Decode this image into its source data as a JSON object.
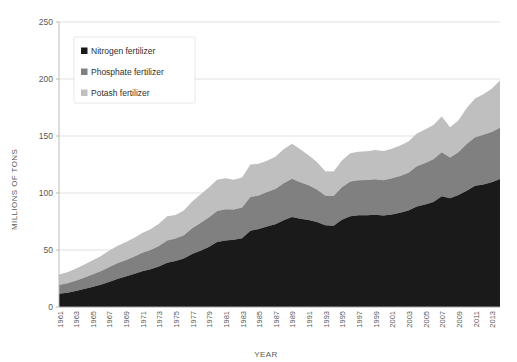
{
  "chart_data": {
    "type": "area",
    "stacked": true,
    "title": "",
    "xlabel": "YEAR",
    "ylabel": "MILLIONS OF TONS",
    "ylim": [
      0,
      250
    ],
    "yticks": [
      0,
      50,
      100,
      150,
      200,
      250
    ],
    "ytick_labels": [
      "0",
      "50",
      "100",
      "150",
      "200",
      "250"
    ],
    "grid": true,
    "grid_axis": "y",
    "legend_position": "upper-left-inside",
    "x": [
      1961,
      1962,
      1963,
      1964,
      1965,
      1966,
      1967,
      1968,
      1969,
      1970,
      1971,
      1972,
      1973,
      1974,
      1975,
      1976,
      1977,
      1978,
      1979,
      1980,
      1981,
      1982,
      1983,
      1984,
      1985,
      1986,
      1987,
      1988,
      1989,
      1990,
      1991,
      1992,
      1993,
      1994,
      1995,
      1996,
      1997,
      1998,
      1999,
      2000,
      2001,
      2002,
      2003,
      2004,
      2005,
      2006,
      2007,
      2008,
      2009,
      2010,
      2011,
      2012,
      2013,
      2014
    ],
    "xtick_labels": [
      "1961",
      "1963",
      "1965",
      "1967",
      "1969",
      "1971",
      "1973",
      "1975",
      "1977",
      "1979",
      "1981",
      "1983",
      "1985",
      "1987",
      "1989",
      "1991",
      "1993",
      "1995",
      "1997",
      "1999",
      "2001",
      "2003",
      "2005",
      "2007",
      "2009",
      "2011",
      "2013"
    ],
    "xlim": [
      1961,
      2014
    ],
    "series": [
      {
        "name": "Nitrogen fertilizer",
        "color": "#1a1a1a",
        "values": [
          11.6,
          12.6,
          14.0,
          15.8,
          17.6,
          19.5,
          21.9,
          24.5,
          26.7,
          28.9,
          31.3,
          33.1,
          35.6,
          38.9,
          40.4,
          42.5,
          46.4,
          49.3,
          52.7,
          57.0,
          58.3,
          58.9,
          60.4,
          66.8,
          68.5,
          70.7,
          72.6,
          76.2,
          78.9,
          77.4,
          76.4,
          74.5,
          71.8,
          71.2,
          76.5,
          79.7,
          80.5,
          80.5,
          80.9,
          80.2,
          81.2,
          82.6,
          84.7,
          88.2,
          90.0,
          92.2,
          97.2,
          95.3,
          98.2,
          102.0,
          106.3,
          107.5,
          109.5,
          112.2
        ]
      },
      {
        "name": "Phosphate fertilizer",
        "color": "#808080",
        "values": [
          7.7,
          8.2,
          9.0,
          9.8,
          10.8,
          11.8,
          13.0,
          13.8,
          14.3,
          15.1,
          16.2,
          16.9,
          18.0,
          19.5,
          19.7,
          20.5,
          22.6,
          24.3,
          25.8,
          27.3,
          27.5,
          26.7,
          26.9,
          29.6,
          29.4,
          30.1,
          31.0,
          32.3,
          33.6,
          32.0,
          30.4,
          28.5,
          26.0,
          26.2,
          28.5,
          30.3,
          30.6,
          30.8,
          31.2,
          31.0,
          31.7,
          32.4,
          33.0,
          35.2,
          36.3,
          37.4,
          38.6,
          35.8,
          37.6,
          41.0,
          42.6,
          43.5,
          44.1,
          45.1
        ]
      },
      {
        "name": "Potash fertilizer",
        "color": "#bfbfbf",
        "values": [
          9.1,
          9.7,
          10.5,
          11.5,
          12.4,
          13.2,
          14.5,
          15.2,
          15.7,
          16.6,
          17.5,
          18.3,
          19.4,
          21.1,
          20.5,
          21.6,
          23.6,
          25.1,
          26.4,
          27.4,
          27.1,
          26.0,
          26.3,
          28.6,
          27.8,
          27.4,
          28.2,
          29.8,
          30.8,
          28.9,
          26.4,
          24.2,
          21.2,
          21.5,
          23.5,
          24.8,
          25.1,
          25.3,
          25.6,
          25.6,
          26.0,
          26.6,
          27.4,
          28.8,
          29.5,
          30.0,
          31.4,
          26.5,
          27.8,
          31.5,
          33.9,
          35.6,
          37.8,
          41.3
        ]
      }
    ]
  },
  "legend": {
    "items": [
      {
        "label": "Nitrogen fertilizer",
        "color": "#1a1a1a"
      },
      {
        "label": "Phosphate fertilizer",
        "color": "#808080"
      },
      {
        "label": "Potash fertilizer",
        "color": "#bfbfbf"
      }
    ]
  }
}
